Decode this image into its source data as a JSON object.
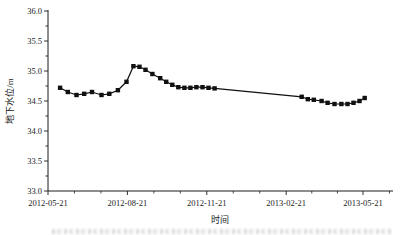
{
  "chart": {
    "y_axis": {
      "label": "地下水位/m",
      "tick_labels": [
        "33.0",
        "33.5",
        "34.0",
        "34.5",
        "35.0",
        "35.5",
        "36.0"
      ]
    },
    "x_axis": {
      "label": "时间",
      "tick_labels": [
        "2012-05-21",
        "2012-08-21",
        "2012-11-21",
        "2013-02-21",
        "2013-05-21"
      ]
    },
    "axis_color": "#1c1c1c",
    "series_color": "#111111",
    "has_cropped_caption": true
  },
  "chart_data": {
    "type": "line",
    "title": "",
    "xlabel": "时间",
    "ylabel": "地下水位/m",
    "ylim": [
      33.0,
      36.0
    ],
    "y_major_step": 0.5,
    "y_minor_step": 0.25,
    "x_range": [
      "2012-05-21",
      "2013-05-21"
    ],
    "x_major_ticks": [
      "2012-05-21",
      "2012-08-21",
      "2012-11-21",
      "2013-02-21",
      "2013-05-21"
    ],
    "x_minor_divisions": 3,
    "grid": false,
    "legend": "none",
    "marker": "filled-square",
    "series": [
      {
        "name": "地下水位",
        "points": [
          [
            "2012-06-04",
            34.72
          ],
          [
            "2012-06-13",
            34.65
          ],
          [
            "2012-06-23",
            34.6
          ],
          [
            "2012-07-02",
            34.62
          ],
          [
            "2012-07-11",
            34.65
          ],
          [
            "2012-07-22",
            34.6
          ],
          [
            "2012-07-31",
            34.62
          ],
          [
            "2012-08-10",
            34.68
          ],
          [
            "2012-08-20",
            34.82
          ],
          [
            "2012-08-28",
            35.08
          ],
          [
            "2012-09-04",
            35.07
          ],
          [
            "2012-09-11",
            35.02
          ],
          [
            "2012-09-19",
            34.95
          ],
          [
            "2012-09-28",
            34.88
          ],
          [
            "2012-10-05",
            34.82
          ],
          [
            "2012-10-12",
            34.77
          ],
          [
            "2012-10-19",
            34.73
          ],
          [
            "2012-10-26",
            34.72
          ],
          [
            "2012-11-02",
            34.72
          ],
          [
            "2012-11-09",
            34.73
          ],
          [
            "2012-11-16",
            34.73
          ],
          [
            "2012-11-23",
            34.72
          ],
          [
            "2012-11-30",
            34.71
          ],
          [
            "2013-03-11",
            34.57
          ],
          [
            "2013-03-18",
            34.53
          ],
          [
            "2013-03-25",
            34.52
          ],
          [
            "2013-04-03",
            34.5
          ],
          [
            "2013-04-10",
            34.47
          ],
          [
            "2013-04-18",
            34.45
          ],
          [
            "2013-04-26",
            34.45
          ],
          [
            "2013-05-03",
            34.45
          ],
          [
            "2013-05-10",
            34.47
          ],
          [
            "2013-05-17",
            34.5
          ],
          [
            "2013-05-23",
            34.55
          ]
        ]
      }
    ]
  }
}
